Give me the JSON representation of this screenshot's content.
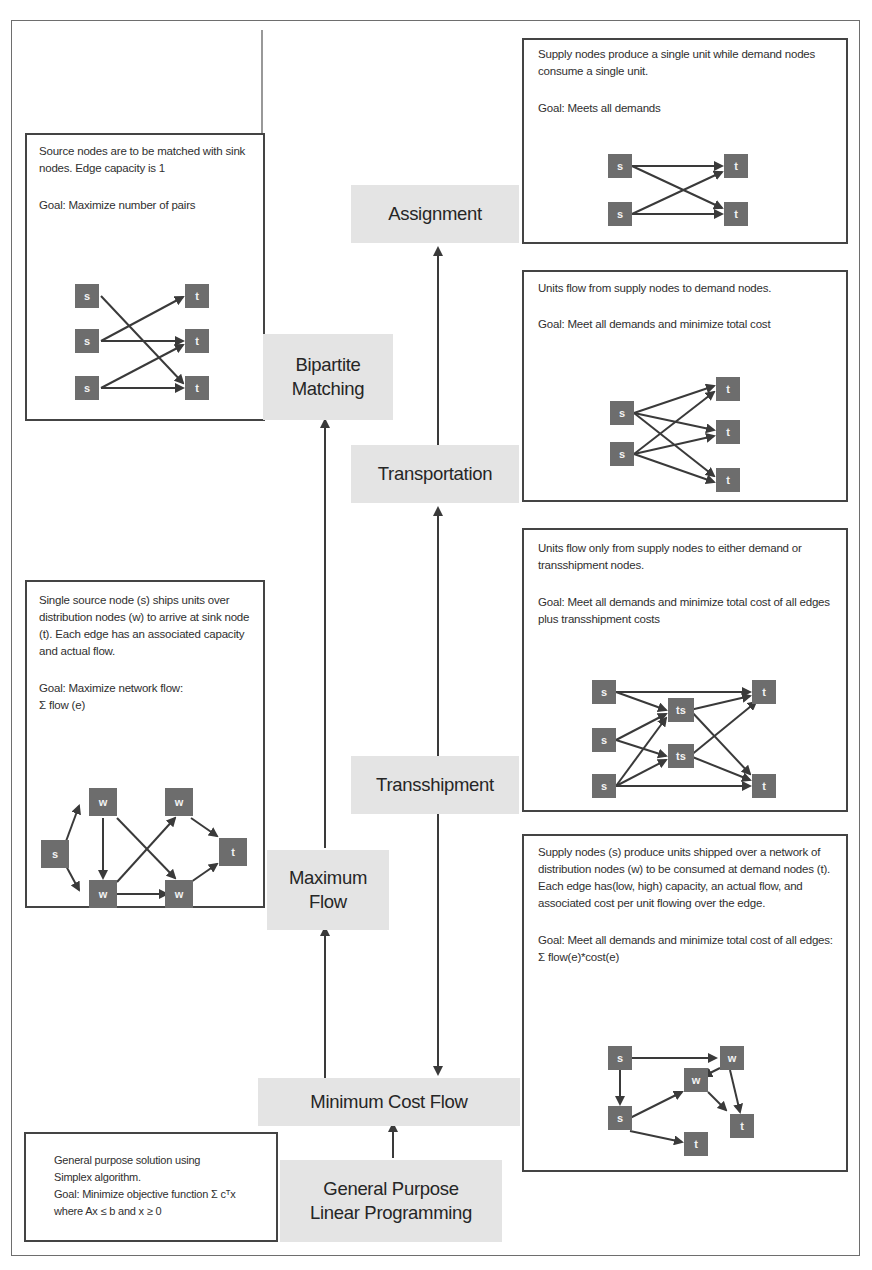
{
  "diagram": {
    "accent_colors": {
      "label_fill": "#e4e4e4",
      "node_fill": "#6d6d6d",
      "border": "#444444",
      "text": "#2a2a2a"
    },
    "problems": {
      "assignment": {
        "label": "Assignment",
        "description": "Supply nodes produce a single unit while demand nodes consume a single unit.",
        "goal": "Goal: Meets all demands",
        "nodes": [
          "s",
          "s",
          "t",
          "t"
        ]
      },
      "bipartite_matching": {
        "label_line1": "Bipartite",
        "label_line2": "Matching",
        "description": "Source nodes are to be matched with sink nodes. Edge capacity is 1",
        "goal": "Goal: Maximize number of pairs",
        "nodes": [
          "s",
          "s",
          "s",
          "t",
          "t",
          "t"
        ]
      },
      "transportation": {
        "label": "Transportation",
        "description": "Units flow from supply nodes to demand nodes.",
        "goal": "Goal: Meet all demands and minimize total cost",
        "nodes": [
          "s",
          "s",
          "t",
          "t",
          "t"
        ]
      },
      "transshipment": {
        "label": "Transshipment",
        "description": "Units flow only from supply nodes to either demand or transshipment nodes.",
        "goal": "Goal: Meet all demands and minimize total cost of all edges plus transshipment costs",
        "nodes": [
          "s",
          "s",
          "s",
          "ts",
          "ts",
          "t",
          "t"
        ]
      },
      "maximum_flow": {
        "label_line1": "Maximum",
        "label_line2": "Flow",
        "description": "Single source node (s) ships units over distribution nodes (w) to arrive at sink node (t). Each edge has an associated capacity and actual flow.",
        "goal_line1": "Goal: Maximize network flow:",
        "goal_line2": "Σ flow (e)",
        "nodes": [
          "s",
          "w",
          "w",
          "w",
          "w",
          "t"
        ]
      },
      "minimum_cost_flow": {
        "label": "Minimum Cost Flow",
        "description": "Supply nodes (s) produce units shipped over a network of distribution nodes (w) to be consumed at demand nodes (t). Each edge has(low, high) capacity, an actual flow, and associated cost per unit flowing over the edge.",
        "goal": "Goal: Meet all demands and minimize total cost of all edges: Σ flow(e)*cost(e)",
        "nodes": [
          "s",
          "s",
          "w",
          "w",
          "t",
          "t"
        ]
      },
      "linear_programming": {
        "label_line1": "General Purpose",
        "label_line2": "Linear Programming",
        "desc_line1": "General purpose solution using",
        "desc_line2": "Simplex algorithm.",
        "desc_line3": "Goal: Minimize objective function Σ cᵀx",
        "desc_line4": "where Ax ≤ b and x ≥ 0"
      }
    },
    "relations": [
      "General Purpose Linear Programming → Minimum Cost Flow",
      "Minimum Cost Flow → Maximum Flow",
      "Maximum Flow → Bipartite Matching",
      "Minimum Cost Flow ↔ Transshipment",
      "Transshipment → Transportation",
      "Transportation → Assignment"
    ]
  }
}
